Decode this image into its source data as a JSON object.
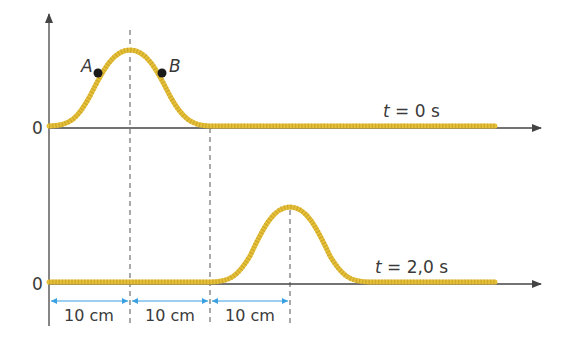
{
  "diagram": {
    "colors": {
      "axis": "#444444",
      "rope": "#e6c035",
      "rope_dots": "#b8922a",
      "dashed": "#555555",
      "dimension": "#3aa0e0",
      "point": "#1a1a1a",
      "text": "#3a3a3a"
    },
    "top_graph": {
      "zero_label": "0",
      "time_label_t": "t",
      "time_label_rest": " = 0 s",
      "points": [
        {
          "name": "A",
          "label": "A"
        },
        {
          "name": "B",
          "label": "B"
        }
      ]
    },
    "bottom_graph": {
      "zero_label": "0",
      "time_label_t": "t",
      "time_label_rest": " = 2,0 s"
    },
    "dimensions": [
      {
        "label": "10 cm"
      },
      {
        "label": "10 cm"
      },
      {
        "label": "10 cm"
      }
    ]
  }
}
